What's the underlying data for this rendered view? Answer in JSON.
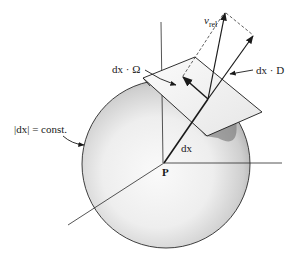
{
  "diagram": {
    "type": "vector-geometry",
    "labels": {
      "v_rel_main": "v",
      "v_rel_sub": "rel",
      "dx_omega": "dx · Ω",
      "dx_d": "dx · D",
      "norm_const": "|dx| = const.",
      "dx": "dx",
      "point": "P"
    },
    "colors": {
      "ink": "#1a1a1a",
      "sphere_light": "#f4f4f4",
      "sphere_dark": "#9a9a9a",
      "plane_fill": "#f2f2f2",
      "background": "#ffffff"
    }
  }
}
